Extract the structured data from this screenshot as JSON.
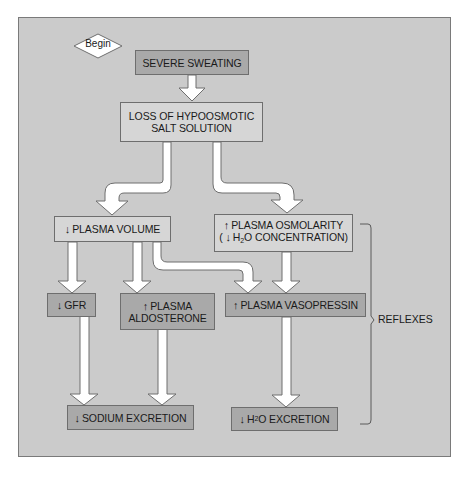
{
  "diagram": {
    "start": {
      "label": "Begin"
    },
    "nodes": {
      "severe_sweating": {
        "text": "SEVERE SWEATING"
      },
      "loss_salt": {
        "line1": "LOSS OF HYPOOSMOTIC",
        "line2": "SALT SOLUTION"
      },
      "plasma_volume": {
        "arrow": "↓",
        "text": "PLASMA VOLUME"
      },
      "plasma_osmolarity": {
        "arrow": "↑",
        "line1": "PLASMA OSMOLARITY",
        "line2_open": "(",
        "line2_arrow": "↓",
        "line2_h": "H",
        "line2_sub": "2",
        "line2_rest": "O CONCENTRATION)"
      },
      "gfr": {
        "arrow": "↓",
        "text": "GFR"
      },
      "aldosterone": {
        "arrow": "↑",
        "line1": "PLASMA",
        "line2": "ALDOSTERONE"
      },
      "vasopressin": {
        "arrow": "↑",
        "text": "PLASMA VASOPRESSIN"
      },
      "sodium_excretion": {
        "arrow": "↓",
        "text": "SODIUM EXCRETION"
      },
      "h2o_excretion": {
        "arrow": "↓",
        "h": "H",
        "sub": "2",
        "rest": "O EXCRETION"
      }
    },
    "bracket_label": "REFLEXES",
    "colors": {
      "panel_bg": "#cbcbcb",
      "light_box": "#d6d6d6",
      "dark_box": "#a9a9a9",
      "arrow_fill": "#ffffff",
      "stroke": "#6e6e6e"
    },
    "edges": [
      [
        "severe_sweating",
        "loss_salt"
      ],
      [
        "loss_salt",
        "plasma_volume"
      ],
      [
        "loss_salt",
        "plasma_osmolarity"
      ],
      [
        "plasma_volume",
        "gfr"
      ],
      [
        "plasma_volume",
        "aldosterone"
      ],
      [
        "plasma_volume",
        "vasopressin"
      ],
      [
        "plasma_osmolarity",
        "vasopressin"
      ],
      [
        "gfr",
        "sodium_excretion"
      ],
      [
        "aldosterone",
        "sodium_excretion"
      ],
      [
        "vasopressin",
        "h2o_excretion"
      ]
    ]
  }
}
